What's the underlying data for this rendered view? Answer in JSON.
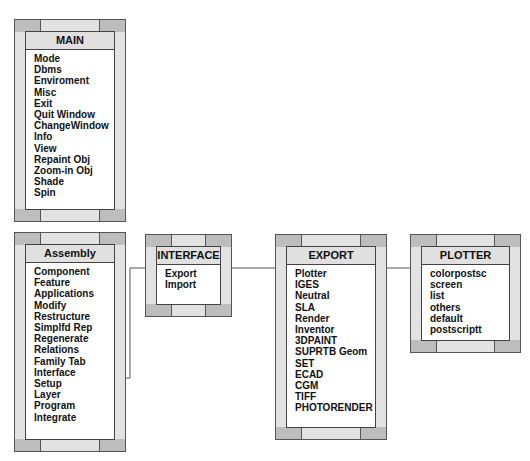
{
  "menus": {
    "main": {
      "title": "MAIN",
      "items": [
        "Mode",
        "Dbms",
        "Enviroment",
        "Misc",
        "Exit",
        "Quit Window",
        "ChangeWindow",
        "Info",
        "View",
        "Repaint Obj",
        "Zoom-in Obj",
        "Shade",
        "Spin"
      ]
    },
    "assembly": {
      "title": "Assembly",
      "items": [
        "Component",
        "Feature",
        "Applications",
        "Modify",
        "Restructure",
        "Simplfd Rep",
        "Regenerate",
        "Relations",
        "Family Tab",
        "Interface",
        "Setup",
        "Layer",
        "Program",
        "Integrate"
      ]
    },
    "interface": {
      "title": "INTERFACE",
      "items": [
        "Export",
        "Import"
      ]
    },
    "export": {
      "title": "EXPORT",
      "items": [
        "Plotter",
        "IGES",
        "Neutral",
        "SLA",
        "Render",
        "Inventor",
        "3DPAINT",
        "SUPRTB Geom",
        "SET",
        "ECAD",
        "CGM",
        "TIFF",
        "PHOTORENDER"
      ]
    },
    "plotter": {
      "title": "PLOTTER",
      "items": [
        "colorpostsc",
        "screen",
        "list",
        "others",
        "default",
        "postscriptt"
      ]
    }
  },
  "connections": [
    {
      "from": "assembly.Interface",
      "to": "interface.Export"
    },
    {
      "from": "interface.Export",
      "to": "export.Plotter"
    },
    {
      "from": "export.Plotter",
      "to": "plotter.colorpostsc"
    }
  ],
  "colors": {
    "frame": "#bdbdbd",
    "title_bg": "#e0e0e0",
    "line": "#555555"
  }
}
